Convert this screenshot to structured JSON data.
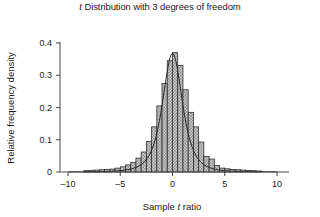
{
  "chart_data": {
    "type": "bar",
    "title": "t Distribution with 3 degrees of freedom",
    "title_prefix": "t",
    "title_rest": " Distribution with 3 degrees of freedom",
    "xlabel_prefix": "Sample ",
    "xlabel_italic": "t",
    "xlabel_suffix": " ratio",
    "xlabel": "Sample t ratio",
    "ylabel": "Relative frequency density",
    "xlim": [
      -10.5,
      10.5
    ],
    "ylim": [
      0,
      0.41
    ],
    "xticks": [
      -10,
      -5,
      0,
      5,
      10
    ],
    "xticklabels": [
      "–10",
      "–5",
      "0",
      "5",
      "10"
    ],
    "yticks": [
      0,
      0.1,
      0.2,
      0.3,
      0.4
    ],
    "yticklabels": [
      "0",
      "0.1",
      "0.2",
      "0.3",
      "0.4"
    ],
    "grid": false,
    "legend": null,
    "bin_width": 0.5,
    "bar_fill": "#b8b8b8",
    "bar_edge": "#2e2e2e",
    "curve_color": "#2b2b2b",
    "bin_left_edges": [
      -8.5,
      -8.0,
      -7.5,
      -7.0,
      -6.5,
      -6.0,
      -5.5,
      -5.0,
      -4.5,
      -4.0,
      -3.5,
      -3.0,
      -2.5,
      -2.0,
      -1.5,
      -1.0,
      -0.5,
      0.0,
      0.5,
      1.0,
      1.5,
      2.0,
      2.5,
      3.0,
      3.5,
      4.0,
      4.5,
      5.0,
      5.5,
      6.0,
      6.5,
      7.0,
      7.5,
      8.0
    ],
    "densities": [
      0.004,
      0.005,
      0.006,
      0.007,
      0.008,
      0.009,
      0.012,
      0.016,
      0.022,
      0.03,
      0.043,
      0.062,
      0.095,
      0.14,
      0.205,
      0.275,
      0.345,
      0.37,
      0.33,
      0.255,
      0.185,
      0.14,
      0.093,
      0.048,
      0.04,
      0.02,
      0.012,
      0.01,
      0.008,
      0.007,
      0.006,
      0.005,
      0.004,
      0.003
    ],
    "curve_note": "Overlaid theoretical t density with 3 degrees of freedom, peak approximately 0.385 at t = 0",
    "curve_peak": 0.385,
    "curve_df": 3
  }
}
